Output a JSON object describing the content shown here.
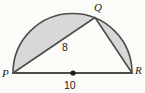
{
  "diagram": {
    "labels": {
      "p": "P",
      "q": "Q",
      "r": "R"
    },
    "measurements": {
      "chord_pq": "8",
      "diameter_pr": "10"
    },
    "colors": {
      "shaded": "#d8d8d8",
      "line": "#4d4d4d",
      "line-dark": "#1a1a1a",
      "text": "#222222",
      "background": "#fbfbf8"
    }
  }
}
